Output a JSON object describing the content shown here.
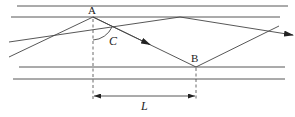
{
  "diagram": {
    "type": "ray-reflection-between-layers",
    "labels": {
      "point_a": "A",
      "point_b": "B",
      "angle": "C",
      "distance": "L"
    },
    "colors": {
      "line": "#444444",
      "background": "#ffffff"
    }
  }
}
